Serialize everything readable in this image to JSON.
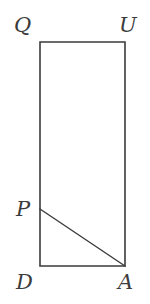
{
  "figure": {
    "kind": "geometry-diagram",
    "canvas": {
      "width": 150,
      "height": 304,
      "background": "#ffffff"
    },
    "style": {
      "stroke_color": "#3b3b3b",
      "stroke_width": 1.6,
      "fill": "none",
      "label_color": "#3b3b3b",
      "label_font_size": 21
    },
    "points": [
      {
        "id": "Q",
        "label": "Q",
        "x": 40,
        "y": 42,
        "label_x": 14,
        "label_y": 15
      },
      {
        "id": "U",
        "label": "U",
        "x": 125,
        "y": 42,
        "label_x": 119,
        "label_y": 15
      },
      {
        "id": "P",
        "label": "P",
        "x": 40,
        "y": 209,
        "label_x": 16,
        "label_y": 199
      },
      {
        "id": "D",
        "label": "D",
        "x": 40,
        "y": 266,
        "label_x": 16,
        "label_y": 272
      },
      {
        "id": "A",
        "label": "A",
        "x": 125,
        "y": 266,
        "label_x": 118,
        "label_y": 272
      }
    ],
    "rectangle": {
      "name": "QUAD",
      "vertices": [
        "Q",
        "U",
        "A",
        "D"
      ],
      "path": "M 40 42 L 125 42 L 125 266 L 40 266 Z"
    },
    "segments": [
      {
        "name": "PA",
        "from": "P",
        "to": "A",
        "x1": 40,
        "y1": 209,
        "x2": 125,
        "y2": 266
      }
    ]
  }
}
